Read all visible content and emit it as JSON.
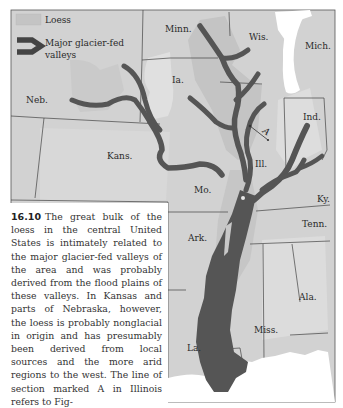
{
  "figure": {
    "number": "16.10",
    "caption": "The great bulk of the loess in the central United States is intimately related to the major glacier-fed valleys of the area and was probably derived from the flood plains of these valleys. In Kansas and parts of Nebraska, however, the loess is probably nonglacial in origin and has presumably been derived from local sources and the more arid regions to the west. The line of section marked A in Illinois refers to Fig-"
  },
  "legend": {
    "items": [
      {
        "label": "Loess",
        "symbol": "light-gray-swatch"
      },
      {
        "label_line1": "Major glacier-fed",
        "label_line2": "valleys",
        "symbol": "dark-thick-line"
      }
    ]
  },
  "map": {
    "section_line_label": "A",
    "states": [
      {
        "label": "Minn."
      },
      {
        "label": "Wis."
      },
      {
        "label": "Mich."
      },
      {
        "label": "Ia."
      },
      {
        "label": "Neb."
      },
      {
        "label": "Ind."
      },
      {
        "label": "Ill."
      },
      {
        "label": "Kans."
      },
      {
        "label": "Mo."
      },
      {
        "label": "Ky."
      },
      {
        "label": "Tenn."
      },
      {
        "label": "Ark."
      },
      {
        "label": "Ala."
      },
      {
        "label": "Miss."
      },
      {
        "label": "La."
      }
    ],
    "colors": {
      "base": "#d4d4d4",
      "loess": "#c2c2c2",
      "loess_light": "#dedede",
      "valley": "#555555",
      "lake": "#ffffff",
      "border": "#444444"
    }
  }
}
